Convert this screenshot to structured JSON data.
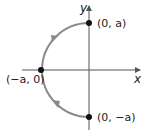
{
  "diagram": {
    "axes": {
      "x_label": "x",
      "y_label": "y"
    },
    "points": [
      {
        "label": "(0, a)",
        "x": 89,
        "y": 23
      },
      {
        "label": "(−a, 0)",
        "x": 40,
        "y": 70
      },
      {
        "label": "(0, −a)",
        "x": 89,
        "y": 116
      }
    ],
    "curve": {
      "type": "semicircle",
      "side": "left",
      "color": "#8a8a8a"
    },
    "colors": {
      "axis": "#555555",
      "point": "#111111"
    }
  }
}
